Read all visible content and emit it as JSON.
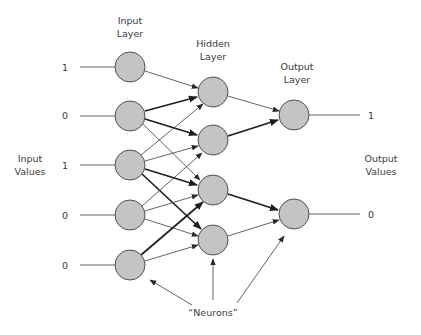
{
  "diagram": {
    "layers": {
      "input": {
        "label_line1": "Input",
        "label_line2": "Layer",
        "nodes": [
          {
            "id": "I1",
            "value": "1"
          },
          {
            "id": "I2",
            "value": "0"
          },
          {
            "id": "I3",
            "value": "1"
          },
          {
            "id": "I4",
            "value": "0"
          },
          {
            "id": "I5",
            "value": "0"
          }
        ]
      },
      "hidden": {
        "label_line1": "Hidden",
        "label_line2": "Layer",
        "nodes": [
          {
            "id": "H1"
          },
          {
            "id": "H2"
          },
          {
            "id": "H3"
          },
          {
            "id": "H4"
          }
        ]
      },
      "output": {
        "label_line1": "Output",
        "label_line2": "Layer",
        "nodes": [
          {
            "id": "O1",
            "value": "1"
          },
          {
            "id": "O2",
            "value": "0"
          }
        ]
      }
    },
    "side_labels": {
      "input_values_line1": "Input",
      "input_values_line2": "Values",
      "output_values_line1": "Output",
      "output_values_line2": "Values"
    },
    "annotation": {
      "neurons_label": "“Neurons”"
    },
    "edges": [
      {
        "from": "I1",
        "to": "H1",
        "weight": "thin"
      },
      {
        "from": "I2",
        "to": "H1",
        "weight": "thick"
      },
      {
        "from": "I2",
        "to": "H2",
        "weight": "thick"
      },
      {
        "from": "I2",
        "to": "H3",
        "weight": "thin"
      },
      {
        "from": "I3",
        "to": "H1",
        "weight": "thin"
      },
      {
        "from": "I3",
        "to": "H2",
        "weight": "thin"
      },
      {
        "from": "I3",
        "to": "H3",
        "weight": "thick"
      },
      {
        "from": "I3",
        "to": "H4",
        "weight": "thick"
      },
      {
        "from": "I4",
        "to": "H2",
        "weight": "thin"
      },
      {
        "from": "I4",
        "to": "H3",
        "weight": "thin"
      },
      {
        "from": "I4",
        "to": "H4",
        "weight": "thin"
      },
      {
        "from": "I5",
        "to": "H2",
        "weight": "thick"
      },
      {
        "from": "I5",
        "to": "H4",
        "weight": "thin"
      },
      {
        "from": "H1",
        "to": "O1",
        "weight": "thin"
      },
      {
        "from": "H2",
        "to": "O1",
        "weight": "thick"
      },
      {
        "from": "H3",
        "to": "O2",
        "weight": "thick"
      },
      {
        "from": "H4",
        "to": "O2",
        "weight": "thin"
      }
    ],
    "colors": {
      "neuron_fill": "#c4c4c4",
      "neuron_stroke": "#505050",
      "edge": "#2a2a2a",
      "text": "#3a3a3a",
      "background": "#ffffff"
    }
  }
}
